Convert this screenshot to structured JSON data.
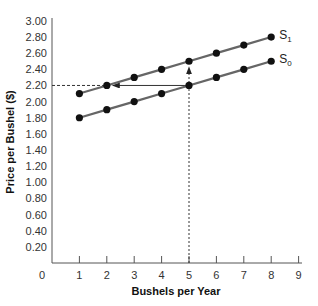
{
  "chart_data": {
    "type": "line",
    "title": "",
    "xlabel": "Bushels per Year",
    "ylabel": "Price per Bushel ($)",
    "xlim": [
      0,
      9
    ],
    "ylim": [
      0,
      3.0
    ],
    "x_ticks": [
      "0",
      "1",
      "2",
      "3",
      "4",
      "5",
      "6",
      "7",
      "8",
      "9"
    ],
    "y_ticks": [
      "0.20",
      "0.40",
      "0.60",
      "0.80",
      "1.00",
      "1.20",
      "1.40",
      "1.60",
      "1.80",
      "2.00",
      "2.20",
      "2.40",
      "2.60",
      "2.80",
      "3.00"
    ],
    "grid": false,
    "x": [
      1,
      2,
      3,
      4,
      5,
      6,
      7,
      8
    ],
    "series": [
      {
        "name": "S0",
        "label_main": "S",
        "label_sub": "0",
        "values": [
          1.8,
          1.9,
          2.0,
          2.1,
          2.2,
          2.3,
          2.4,
          2.5
        ]
      },
      {
        "name": "S1",
        "label_main": "S",
        "label_sub": "1",
        "values": [
          2.1,
          2.2,
          2.3,
          2.4,
          2.5,
          2.6,
          2.7,
          2.8
        ]
      }
    ],
    "annotations": [
      {
        "type": "dashed-line",
        "from": [
          0,
          2.2
        ],
        "to": [
          2,
          2.2
        ],
        "description": "dashed horizontal guide at price 2.20"
      },
      {
        "type": "arrow",
        "from": [
          5,
          2.2
        ],
        "to": [
          2,
          2.2
        ],
        "style": "solid",
        "description": "horizontal shift from S0 to S1 at price 2.20"
      },
      {
        "type": "dashed-arrow",
        "from": [
          5,
          0
        ],
        "to": [
          5,
          2.5
        ],
        "description": "vertical shift from x-axis at 5 up to S1"
      }
    ]
  },
  "colors": {
    "line": "#666666",
    "point": "#111111",
    "axis": "#555555"
  }
}
